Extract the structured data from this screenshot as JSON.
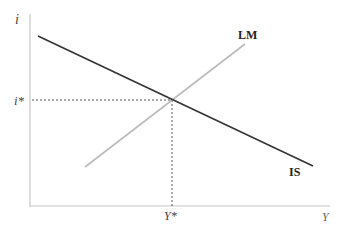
{
  "diagram": {
    "y_axis_label": "i",
    "x_axis_label": "Y",
    "equilibrium_rate_label": "i*",
    "equilibrium_output_label": "Y*",
    "curves": [
      {
        "name": "IS",
        "label": "IS",
        "slope": "downward",
        "color": "#333333"
      },
      {
        "name": "LM",
        "label": "LM",
        "slope": "upward",
        "color": "#bbbbbb"
      }
    ],
    "axis_color": "#c8c8c8",
    "dashed_color": "#555555"
  }
}
